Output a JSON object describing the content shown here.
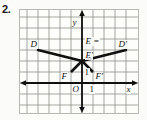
{
  "problem": {
    "number": "2."
  },
  "figure": {
    "type": "coordinate-plane-geometry",
    "axes": {
      "x_label": "x",
      "y_label": "y",
      "origin_label": "O",
      "x_unit_label": "1",
      "y_unit_label": "1"
    },
    "grid": {
      "visible": true,
      "cell_size_units": 1,
      "columns": 10,
      "rows": 9,
      "color": "#8d8d88"
    },
    "colors": {
      "paper": "#fbfbf9",
      "panel": "#fdfdfb",
      "grid_line": "#8d8d88",
      "axis": "#101010",
      "shape_stroke": "#111111",
      "frame_border": "#b9b9b4",
      "text": "#151515"
    },
    "points": [
      {
        "name": "D",
        "label": "D",
        "x": -4,
        "y": 3
      },
      {
        "name": "E",
        "label": "E =",
        "x": 0,
        "y": 3
      },
      {
        "name": "Ep",
        "label": "E'",
        "x": 0,
        "y": 2
      },
      {
        "name": "Dp",
        "label": "D'",
        "x": 4,
        "y": 3
      },
      {
        "name": "F",
        "label": "F",
        "x": -1,
        "y": 1
      },
      {
        "name": "Fp",
        "label": "F'",
        "x": 1,
        "y": 1
      }
    ],
    "shapes": [
      {
        "name": "triangle-DEF",
        "vertices": [
          "D",
          "E",
          "F"
        ],
        "path_units": [
          [
            -4,
            3
          ],
          [
            0,
            2
          ],
          [
            -1,
            1
          ],
          [
            0,
            2
          ]
        ]
      },
      {
        "name": "triangle-DpEpFp",
        "vertices": [
          "D'",
          "E'",
          "F'"
        ],
        "path_units": [
          [
            4,
            3
          ],
          [
            0,
            2
          ],
          [
            1,
            1
          ],
          [
            0,
            2
          ]
        ]
      }
    ],
    "labels": {
      "D": "D",
      "E": "E =",
      "E_prime": "E'",
      "D_prime": "D'",
      "F": "F",
      "F_prime": "F'",
      "origin": "O",
      "unit_x": "1",
      "unit_y": "1",
      "axis_x": "x",
      "axis_y": "y"
    }
  }
}
